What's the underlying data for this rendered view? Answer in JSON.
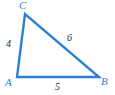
{
  "figure": {
    "type": "geometry-triangle-diagram",
    "background_color": "#ffffff",
    "stroke_color": "#2e7fd4",
    "stroke_width": 2.4,
    "label_color_vertex": "#2e7fd4",
    "label_color_side": "#231f20",
    "vertices": [
      {
        "name": "C",
        "label": "C",
        "x": 25,
        "y": 14
      },
      {
        "name": "A",
        "label": "A",
        "x": 17,
        "y": 77
      },
      {
        "name": "B",
        "label": "B",
        "x": 99,
        "y": 77
      }
    ],
    "sides": [
      {
        "name": "side-ac",
        "from": "A",
        "to": "C",
        "label": "4"
      },
      {
        "name": "side-cb",
        "from": "C",
        "to": "B",
        "label": "6"
      },
      {
        "name": "side-ab",
        "from": "A",
        "to": "B",
        "label": "5"
      }
    ],
    "path": "M 25 14 L 17 77 L 99 77 Z"
  }
}
